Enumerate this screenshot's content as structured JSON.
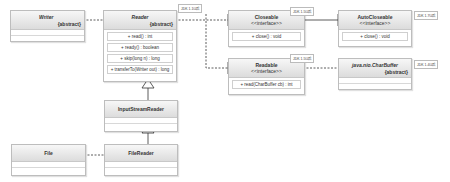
{
  "classes": {
    "writer": {
      "name": "Writer",
      "stereotype": "{abstract}"
    },
    "reader": {
      "name": "Reader",
      "stereotype": "{abstract}",
      "tag": "JDK 1.1以后",
      "methods": [
        "+ read() : int",
        "+ ready() : boolean",
        "+ skip(long n) : long",
        "+ transferTo(Writer out) : long"
      ]
    },
    "closeable": {
      "name": "Closeable",
      "stereotype": "<<interface>>",
      "tag": "JDK 1.5以后",
      "methods": [
        "+ close() : void"
      ]
    },
    "autocloseable": {
      "name": "AutoCloseable",
      "stereotype": "<<interface>>",
      "tag": "JDK 1.7以后",
      "methods": [
        "+ close() : void"
      ]
    },
    "readable": {
      "name": "Readable",
      "stereotype": "<<interface>>",
      "tag": "JDK 1.5以后",
      "methods": [
        "+ read(CharBuffer cb) : int"
      ]
    },
    "charbuffer": {
      "name": "java.nio.CharBuffer",
      "stereotype": "{abstract}",
      "tag": "JDK 1.4以后"
    },
    "inputstreamreader": {
      "name": "InputStreamReader"
    },
    "filereader": {
      "name": "FileReader"
    },
    "file": {
      "name": "File"
    }
  }
}
